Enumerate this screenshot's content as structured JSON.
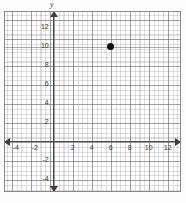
{
  "figure": {
    "kind": "coordinate-plane",
    "background_color": "#fdfdfd",
    "frame_color": "#8a8a8a",
    "axis_color": "#4a4a4a",
    "grid_major_color": "#696969",
    "grid_minor_color": "#969696",
    "point_color": "#111111"
  },
  "axis_names": {
    "x": "x",
    "y": "y"
  },
  "chart_data": {
    "type": "scatter",
    "title": "",
    "xlabel": "x",
    "ylabel": "y",
    "xlim": [
      -5,
      13
    ],
    "ylim": [
      -5,
      13.5
    ],
    "grid": true,
    "grid_major_step": 2,
    "grid_minor_step": 0.5,
    "legend": "none",
    "xticks": [
      -4,
      -2,
      2,
      4,
      6,
      8,
      10,
      12
    ],
    "yticks": [
      -4,
      -2,
      2,
      4,
      6,
      8,
      10,
      12
    ],
    "xtick_labels": [
      "-4",
      "-2",
      "2",
      "4",
      "6",
      "8",
      "10",
      "12"
    ],
    "ytick_labels": [
      "-4",
      "-2",
      "2",
      "4",
      "6",
      "8",
      "10",
      "12"
    ],
    "points": [
      {
        "label": "",
        "x": 6,
        "y": 10
      }
    ],
    "series": [
      {
        "name": "plotted point",
        "x": [
          6
        ],
        "values": [
          10
        ],
        "marker": "filled-circle",
        "color": "#111111"
      }
    ]
  }
}
